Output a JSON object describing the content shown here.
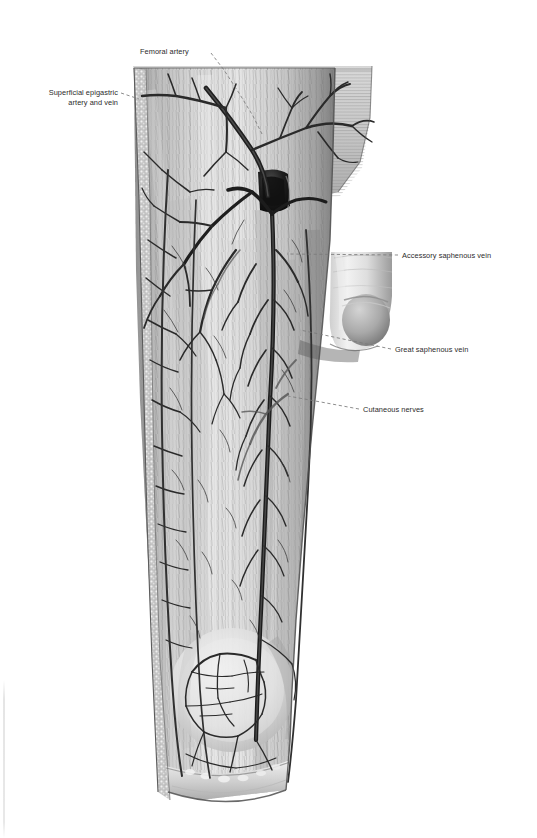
{
  "figure": {
    "view": "anterior",
    "medium": "grayscale anatomical illustration",
    "background_color": "#ffffff",
    "ink_color": "#2b2b2b",
    "leader_color": "#7a7a7a"
  },
  "labels": [
    {
      "id": "femoral-artery",
      "text": "Femoral artery",
      "align": "left",
      "x": 140,
      "y": 47,
      "leader": [
        [
          211,
          53
        ],
        [
          224,
          70
        ],
        [
          239,
          93
        ],
        [
          253,
          116
        ],
        [
          262,
          134
        ]
      ]
    },
    {
      "id": "superficial-epigastric",
      "text": "Superficial epigastric\nartery and vein",
      "align": "right",
      "x": 28,
      "y": 88,
      "leader": [
        [
          121,
          93
        ],
        [
          130,
          96
        ],
        [
          139,
          99
        ]
      ]
    },
    {
      "id": "accessory-saphenous-vein",
      "text": "Accessory saphenous vein",
      "align": "left",
      "x": 402,
      "y": 251,
      "leader": [
        [
          398,
          255
        ],
        [
          360,
          255
        ],
        [
          318,
          255
        ],
        [
          287,
          254
        ]
      ]
    },
    {
      "id": "great-saphenous-vein",
      "text": "Great saphenous vein",
      "align": "left",
      "x": 395,
      "y": 345,
      "leader": [
        [
          391,
          349
        ],
        [
          360,
          343
        ],
        [
          330,
          337
        ],
        [
          300,
          330
        ]
      ]
    },
    {
      "id": "cutaneous-nerves",
      "text": "Cutaneous nerves",
      "align": "left",
      "x": 363,
      "y": 405,
      "leader": [
        [
          359,
          409
        ],
        [
          335,
          405
        ],
        [
          310,
          400
        ],
        [
          288,
          396
        ]
      ]
    }
  ],
  "structures": [
    "femoral artery",
    "superficial epigastric artery and vein",
    "accessory saphenous vein",
    "great saphenous vein",
    "cutaneous nerves",
    "saphenous opening (fossa ovalis)",
    "fascia lata",
    "spermatic cord and penis",
    "patella region"
  ]
}
